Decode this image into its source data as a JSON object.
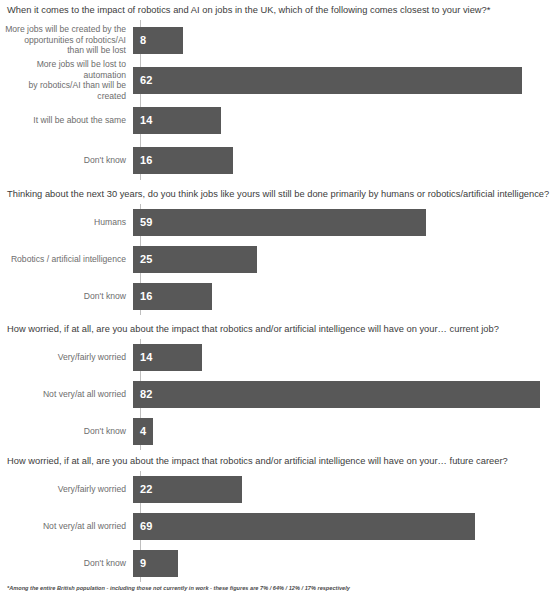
{
  "chart_data": {
    "type": "bar",
    "orientation": "horizontal",
    "title": "",
    "xlabel": "",
    "ylabel": "",
    "grid": false,
    "legend": false,
    "value_suffix": "%",
    "bar_color": "#585858",
    "value_label_color": "#ffffff",
    "axis_color": "#bfbfbf",
    "panels": [
      {
        "title": "When it comes to the impact of robotics and AI on jobs in the UK, which of the following comes closest to your view?*",
        "xlim": [
          0,
          62
        ],
        "px_per_unit": 6.27,
        "categories": [
          "More jobs will be created by the\nopportunities of robotics/AI\nthan will be lost",
          "More jobs will be lost to automation\nby robotics/AI than will be created",
          "It will be about the same",
          "Don't know"
        ],
        "values": [
          8,
          62,
          14,
          16
        ]
      },
      {
        "title": "Thinking about the next 30 years, do you think jobs like yours will still be done primarily by humans or robotics/artificial intelligence?",
        "xlim": [
          0,
          82
        ],
        "px_per_unit": 4.96,
        "categories": [
          "Humans",
          "Robotics / artificial intelligence",
          "Don't know"
        ],
        "values": [
          59,
          25,
          16
        ]
      },
      {
        "title": "How worried, if at all, are you about the impact that robotics and/or artificial intelligence will have on your… current job?",
        "xlim": [
          0,
          82
        ],
        "px_per_unit": 4.96,
        "categories": [
          "Very/fairly worried",
          "Not very/at all worried",
          "Don't know"
        ],
        "values": [
          14,
          82,
          4
        ]
      },
      {
        "title": "How worried, if at all, are you about the impact that robotics and/or artificial intelligence will have on your… future career?",
        "xlim": [
          0,
          82
        ],
        "px_per_unit": 4.96,
        "categories": [
          "Very/fairly worried",
          "Not very/at all worried",
          "Don't know"
        ],
        "values": [
          22,
          69,
          9
        ]
      }
    ]
  },
  "footnote": "*Among the entire British population - including those not currently in work - these figures are 7% / 64% / 12% / 17% respectively"
}
